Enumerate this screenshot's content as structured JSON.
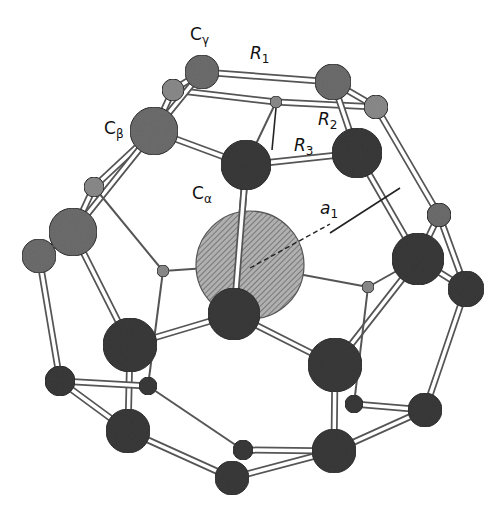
{
  "figure": {
    "colors": {
      "background": "#ffffff",
      "bond_outline": "#555555",
      "bond_fill": "#ffffff",
      "atom_dark": "#3a3a3a",
      "atom_mid": "#6e6e6e",
      "atom_light": "#8c8c8c",
      "central_atom": "#9a9a9a",
      "guide_line": "#222222"
    },
    "labels": {
      "c_gamma": {
        "main": "C",
        "sub": "γ"
      },
      "c_beta": {
        "main": "C",
        "sub": "β"
      },
      "c_alpha": {
        "main": "C",
        "sub": "α"
      },
      "r1": {
        "main": "R",
        "sub": "1"
      },
      "r2": {
        "main": "R",
        "sub": "2"
      },
      "r3": {
        "main": "R",
        "sub": "3"
      },
      "a1": {
        "main": "a",
        "sub": "1"
      }
    },
    "central_atom": {
      "cx": 250,
      "cy": 265,
      "r": 54
    },
    "atoms": [
      {
        "id": "cgamma",
        "cx": 202,
        "cy": 72,
        "r": 17,
        "shade": "mid"
      },
      {
        "id": "top_right",
        "cx": 333,
        "cy": 82,
        "r": 18,
        "shade": "mid"
      },
      {
        "id": "top_left_small",
        "cx": 173,
        "cy": 90,
        "r": 11,
        "shade": "light"
      },
      {
        "id": "top_mid_tiny",
        "cx": 276,
        "cy": 102,
        "r": 6,
        "shade": "light"
      },
      {
        "id": "top_right_small",
        "cx": 376,
        "cy": 107,
        "r": 12,
        "shade": "light"
      },
      {
        "id": "cbeta",
        "cx": 154,
        "cy": 131,
        "r": 24,
        "shade": "mid"
      },
      {
        "id": "r3_atom",
        "cx": 357,
        "cy": 153,
        "r": 25,
        "shade": "dark"
      },
      {
        "id": "calpha",
        "cx": 246,
        "cy": 165,
        "r": 25,
        "shade": "dark"
      },
      {
        "id": "left_small",
        "cx": 94,
        "cy": 187,
        "r": 10,
        "shade": "light"
      },
      {
        "id": "left_big",
        "cx": 73,
        "cy": 232,
        "r": 24,
        "shade": "mid"
      },
      {
        "id": "far_left",
        "cx": 39,
        "cy": 256,
        "r": 17,
        "shade": "mid"
      },
      {
        "id": "right_small",
        "cx": 439,
        "cy": 215,
        "r": 12,
        "shade": "mid"
      },
      {
        "id": "right_big",
        "cx": 418,
        "cy": 259,
        "r": 26,
        "shade": "dark"
      },
      {
        "id": "far_right",
        "cx": 466,
        "cy": 289,
        "r": 18,
        "shade": "dark"
      },
      {
        "id": "left_tiny",
        "cx": 163,
        "cy": 271,
        "r": 6,
        "shade": "light"
      },
      {
        "id": "right_tiny",
        "cx": 368,
        "cy": 287,
        "r": 6,
        "shade": "light"
      },
      {
        "id": "center_bottom",
        "cx": 234,
        "cy": 314,
        "r": 26,
        "shade": "dark"
      },
      {
        "id": "lower_left_big",
        "cx": 130,
        "cy": 345,
        "r": 27,
        "shade": "dark"
      },
      {
        "id": "lower_right_big",
        "cx": 335,
        "cy": 365,
        "r": 27,
        "shade": "dark"
      },
      {
        "id": "bottom_left_far",
        "cx": 60,
        "cy": 381,
        "r": 15,
        "shade": "dark"
      },
      {
        "id": "bottom_left_tiny",
        "cx": 148,
        "cy": 386,
        "r": 9,
        "shade": "dark"
      },
      {
        "id": "bottom_right_tiny",
        "cx": 354,
        "cy": 404,
        "r": 9,
        "shade": "dark"
      },
      {
        "id": "bottom_right_far",
        "cx": 425,
        "cy": 410,
        "r": 17,
        "shade": "dark"
      },
      {
        "id": "bottom_left_big",
        "cx": 128,
        "cy": 431,
        "r": 22,
        "shade": "dark"
      },
      {
        "id": "bottom_right_big",
        "cx": 334,
        "cy": 451,
        "r": 22,
        "shade": "dark"
      },
      {
        "id": "bottom_center_tiny",
        "cx": 243,
        "cy": 450,
        "r": 10,
        "shade": "dark"
      },
      {
        "id": "bottom_center_big",
        "cx": 232,
        "cy": 478,
        "r": 17,
        "shade": "dark"
      }
    ],
    "bonds": [
      [
        "cgamma",
        "top_right",
        "double"
      ],
      [
        "top_left_small",
        "top_mid_tiny",
        "double"
      ],
      [
        "top_mid_tiny",
        "top_right_small",
        "double"
      ],
      [
        "cgamma",
        "top_left_small",
        "double"
      ],
      [
        "top_right",
        "top_right_small",
        "double"
      ],
      [
        "cgamma",
        "cbeta",
        "double"
      ],
      [
        "top_left_small",
        "cbeta",
        "double"
      ],
      [
        "top_right",
        "r3_atom",
        "double"
      ],
      [
        "cbeta",
        "calpha",
        "double"
      ],
      [
        "r3_atom",
        "calpha",
        "double"
      ],
      [
        "top_mid_tiny",
        "calpha",
        "single"
      ],
      [
        "cbeta",
        "left_small",
        "double"
      ],
      [
        "left_small",
        "left_big",
        "double"
      ],
      [
        "cbeta",
        "left_big",
        "double"
      ],
      [
        "left_big",
        "far_left",
        "double"
      ],
      [
        "top_right_small",
        "right_small",
        "double"
      ],
      [
        "r3_atom",
        "right_big",
        "double"
      ],
      [
        "right_small",
        "right_big",
        "double"
      ],
      [
        "right_small",
        "far_right",
        "double"
      ],
      [
        "right_big",
        "far_right",
        "double"
      ],
      [
        "calpha",
        "center_bottom",
        "double"
      ],
      [
        "left_small",
        "left_tiny",
        "single"
      ],
      [
        "left_tiny",
        "central_atom",
        "single"
      ],
      [
        "right_tiny",
        "central_atom",
        "single"
      ],
      [
        "right_big",
        "right_tiny",
        "single"
      ],
      [
        "left_big",
        "lower_left_big",
        "double"
      ],
      [
        "center_bottom",
        "lower_left_big",
        "double"
      ],
      [
        "center_bottom",
        "lower_right_big",
        "double"
      ],
      [
        "right_big",
        "lower_right_big",
        "double"
      ],
      [
        "left_tiny",
        "bottom_left_tiny",
        "single"
      ],
      [
        "right_tiny",
        "bottom_right_tiny",
        "single"
      ],
      [
        "far_left",
        "bottom_left_far",
        "double"
      ],
      [
        "far_right",
        "bottom_right_far",
        "double"
      ],
      [
        "lower_left_big",
        "bottom_left_big",
        "double"
      ],
      [
        "lower_right_big",
        "bottom_right_big",
        "double"
      ],
      [
        "bottom_left_far",
        "bottom_left_tiny",
        "double"
      ],
      [
        "bottom_left_far",
        "bottom_left_big",
        "double"
      ],
      [
        "bottom_left_tiny",
        "bottom_center_tiny",
        "single"
      ],
      [
        "bottom_right_tiny",
        "bottom_right_far",
        "double"
      ],
      [
        "bottom_right_big",
        "bottom_right_far",
        "double"
      ],
      [
        "bottom_center_tiny",
        "bottom_right_big",
        "double"
      ],
      [
        "bottom_left_big",
        "bottom_center_big",
        "double"
      ],
      [
        "bottom_center_big",
        "bottom_right_big",
        "double"
      ]
    ],
    "a1_line": {
      "x1": 250,
      "y1": 268,
      "x2": 398,
      "y2": 187
    }
  }
}
